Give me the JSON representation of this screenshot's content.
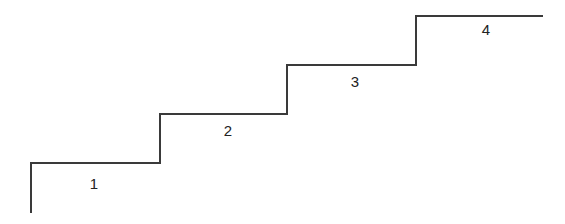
{
  "diagram": {
    "type": "staircase",
    "stroke_color": "#3a3a3a",
    "background": "#ffffff",
    "steps": [
      {
        "label": "1"
      },
      {
        "label": "2"
      },
      {
        "label": "3"
      },
      {
        "label": "4"
      }
    ]
  }
}
